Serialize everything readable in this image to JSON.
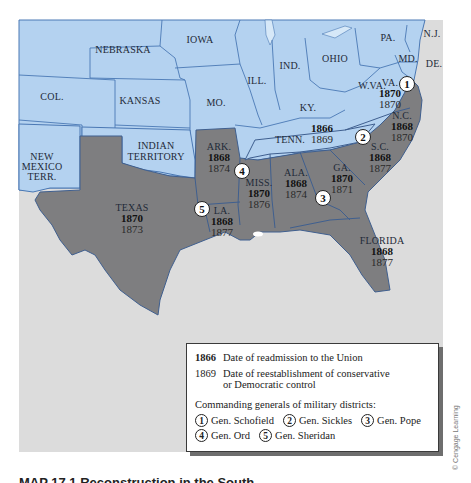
{
  "colors": {
    "union_states": "#b4d2f0",
    "union_border": "#4a78b4",
    "confederate_states": "#7e7e80",
    "confederate_border": "#3f5f8f",
    "water": "#dcdcdc",
    "tennessee": "#b4d2f0"
  },
  "map": {
    "union_states": [
      {
        "id": "nebraska",
        "label": "NEBRASKA"
      },
      {
        "id": "iowa",
        "label": "IOWA"
      },
      {
        "id": "colorado",
        "label": "COL."
      },
      {
        "id": "kansas",
        "label": "KANSAS"
      },
      {
        "id": "missouri",
        "label": "MO."
      },
      {
        "id": "illinois",
        "label": "ILL."
      },
      {
        "id": "indiana",
        "label": "IND."
      },
      {
        "id": "ohio",
        "label": "OHIO"
      },
      {
        "id": "pennsylvania",
        "label": "PA."
      },
      {
        "id": "new-jersey",
        "label": "N.J."
      },
      {
        "id": "maryland",
        "label": "MD."
      },
      {
        "id": "delaware",
        "label": "DE."
      },
      {
        "id": "west-virginia",
        "label": "W.VA."
      },
      {
        "id": "kentucky",
        "label": "KY."
      },
      {
        "id": "indian-territory",
        "label_line1": "INDIAN",
        "label_line2": "TERRITORY"
      },
      {
        "id": "new-mexico",
        "label_line1": "NEW",
        "label_line2": "MEXICO",
        "label_line3": "TERR."
      }
    ],
    "confederate_states": [
      {
        "id": "virginia",
        "label": "VA.",
        "readmitted": "1870",
        "restored": "1870"
      },
      {
        "id": "north-carolina",
        "label": "N.C.",
        "readmitted": "1868",
        "restored": "1870"
      },
      {
        "id": "south-carolina",
        "label": "S.C.",
        "readmitted": "1868",
        "restored": "1877"
      },
      {
        "id": "tennessee",
        "label": "TENN.",
        "readmitted": "1866",
        "restored": "1869"
      },
      {
        "id": "arkansas",
        "label": "ARK.",
        "readmitted": "1868",
        "restored": "1874"
      },
      {
        "id": "mississippi",
        "label": "MISS.",
        "readmitted": "1870",
        "restored": "1876"
      },
      {
        "id": "alabama",
        "label": "ALA.",
        "readmitted": "1868",
        "restored": "1874"
      },
      {
        "id": "georgia",
        "label": "GA.",
        "readmitted": "1870",
        "restored": "1871"
      },
      {
        "id": "texas",
        "label": "TEXAS",
        "readmitted": "1870",
        "restored": "1873"
      },
      {
        "id": "louisiana",
        "label": "LA.",
        "readmitted": "1868",
        "restored": "1877"
      },
      {
        "id": "florida",
        "label": "FLORIDA",
        "readmitted": "1868",
        "restored": "1877"
      }
    ],
    "district_markers": [
      "1",
      "2",
      "3",
      "4",
      "5"
    ]
  },
  "legend": {
    "readmission_year": "1866",
    "readmission_text": "Date of readmission to the Union",
    "control_year": "1869",
    "control_text_line1": "Date of reestablishment of conservative",
    "control_text_line2": "or Democratic control",
    "generals_title": "Commanding generals of military districts:",
    "generals": [
      {
        "num": "1",
        "name": "Gen. Schofield"
      },
      {
        "num": "2",
        "name": "Gen. Sickles"
      },
      {
        "num": "3",
        "name": "Gen. Pope"
      },
      {
        "num": "4",
        "name": "Gen. Ord"
      },
      {
        "num": "5",
        "name": "Gen. Sheridan"
      }
    ]
  },
  "credit": "© Cengage Learning",
  "caption": "MAP 17.1 Reconstruction in the South"
}
